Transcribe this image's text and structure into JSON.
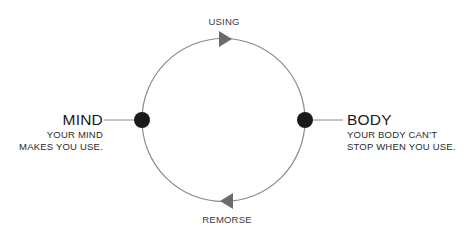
{
  "diagram": {
    "type": "cycle",
    "stages": {
      "top": "USING",
      "bottom": "REMORSE"
    },
    "nodes": {
      "left": {
        "title": "MIND",
        "lines": [
          "YOUR MIND",
          "MAKES YOU USE."
        ]
      },
      "right": {
        "title": "BODY",
        "lines": [
          "YOUR BODY CAN'T",
          "STOP WHEN YOU USE."
        ]
      }
    },
    "flow_direction": "clockwise",
    "colors": {
      "circle_stroke": "#8a8a8a",
      "node_fill": "#1a1a1a",
      "arrow_fill": "#6b6b6b",
      "text": "#1a1a1a"
    }
  }
}
